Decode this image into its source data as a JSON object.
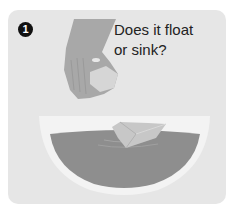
{
  "step": {
    "number": "1",
    "question_line1": "Does it float",
    "question_line2": "or sink?"
  },
  "illustration": {
    "hand": "hand-holding-object-icon",
    "bowl": "bowl-of-water-icon",
    "floating_object": "floating-sponge-icon"
  },
  "colors": {
    "card_background": "#e6e6e6",
    "badge": "#111111",
    "text": "#222222",
    "bowl": "#f2f2f2",
    "water": "#8c8c8c",
    "hand": "#a6a6a6"
  }
}
